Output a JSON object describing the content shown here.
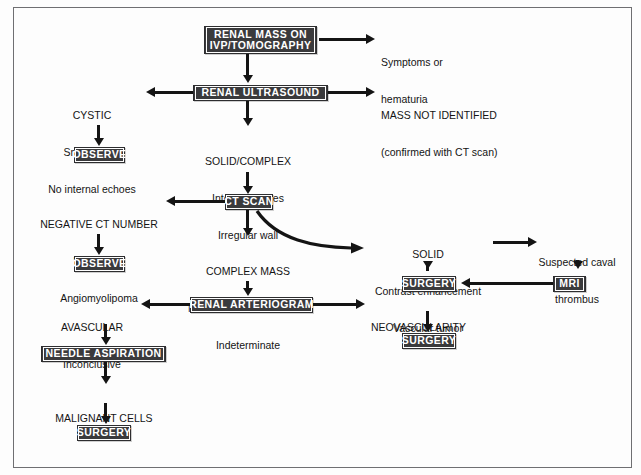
{
  "diagram": {
    "title_node": {
      "line1": "RENAL MASS ON",
      "line2": "IVP/TOMOGRAPHY"
    },
    "colors": {
      "box_fill": "#3a3a3c",
      "box_text": "#ffffff",
      "connector": "#141414",
      "frame": "#6f6f72",
      "page_bg": "#fdfdfd"
    },
    "nodes": [
      {
        "id": "renal-mass-on-ivp-tomography",
        "type": "box",
        "label": "RENAL MASS ON\nIVP/TOMOGRAPHY"
      },
      {
        "id": "symptoms-or-hematuria",
        "type": "label",
        "label": "Symptoms or\nhematuria"
      },
      {
        "id": "renal-ultrasound",
        "type": "box",
        "label": "RENAL ULTRASOUND"
      },
      {
        "id": "mass-not-identified",
        "type": "label",
        "label": "MASS NOT IDENTIFIED\n(confirmed with CT scan)"
      },
      {
        "id": "cystic",
        "type": "label",
        "label": "CYSTIC\nSmooth wall\nNo internal echoes"
      },
      {
        "id": "observe-cystic",
        "type": "box",
        "label": "OBSERVE"
      },
      {
        "id": "solid-complex",
        "type": "label",
        "label": "SOLID/COMPLEX\nInternal echoes\nIrregular wall"
      },
      {
        "id": "ct-scan",
        "type": "box",
        "label": "CT SCAN"
      },
      {
        "id": "negative-ct-number",
        "type": "label",
        "label": "NEGATIVE CT NUMBER\nFat density\nAngiomyolipoma"
      },
      {
        "id": "observe-negative-ct",
        "type": "box",
        "label": "OBSERVE"
      },
      {
        "id": "complex-mass",
        "type": "label",
        "label": "COMPLEX MASS\nNo contrast enhancement\nIndeterminate"
      },
      {
        "id": "solid-contrast-enhancement",
        "type": "label",
        "label": "SOLID\nContrast enhancement\nVascular tumor"
      },
      {
        "id": "suspected-caval-thrombus",
        "type": "label",
        "label": "Suspected caval\nthrombus"
      },
      {
        "id": "mri",
        "type": "box",
        "label": "MRI"
      },
      {
        "id": "surgery-solid",
        "type": "box",
        "label": "SURGERY"
      },
      {
        "id": "renal-arteriogram",
        "type": "box",
        "label": "RENAL ARTERIOGRAM"
      },
      {
        "id": "avascular",
        "type": "label",
        "label": "AVASCULAR\nInconclusive"
      },
      {
        "id": "neovascularity",
        "type": "label",
        "label": "NEOVASCULARITY"
      },
      {
        "id": "surgery-neovascularity",
        "type": "box",
        "label": "SURGERY"
      },
      {
        "id": "needle-aspiration",
        "type": "box",
        "label": "NEEDLE ASPIRATION"
      },
      {
        "id": "malignant-cells",
        "type": "label",
        "label": "MALIGNANT CELLS"
      },
      {
        "id": "surgery-malignant-cells",
        "type": "box",
        "label": "SURGERY"
      }
    ],
    "text": {
      "renal_mass_line1": "RENAL MASS ON",
      "renal_mass_line2": "IVP/TOMOGRAPHY",
      "symptoms_line1": "Symptoms or",
      "symptoms_line2": "hematuria",
      "renal_ultrasound": "RENAL ULTRASOUND",
      "mass_not_identified_line1": "MASS NOT IDENTIFIED",
      "mass_not_identified_line2": "(confirmed with CT scan)",
      "cystic_head": "CYSTIC",
      "cystic_line1": "Smooth wall",
      "cystic_line2": "No internal echoes",
      "observe_1": "OBSERVE",
      "solid_complex_head": "SOLID/COMPLEX",
      "solid_complex_line1": "Internal echoes",
      "solid_complex_line2": "Irregular wall",
      "ct_scan": "CT SCAN",
      "negative_ct_head": "NEGATIVE CT NUMBER",
      "negative_ct_line1": "Fat density",
      "negative_ct_line2": "Angiomyolipoma",
      "observe_2": "OBSERVE",
      "complex_mass_head": "COMPLEX MASS",
      "complex_mass_line1": "No contrast enhancement",
      "complex_mass_line2": "Indeterminate",
      "solid_head": "SOLID",
      "solid_line1": "Contrast enhancement",
      "solid_line2": "Vascular tumor",
      "caval_line1": "Suspected caval",
      "caval_line2": "thrombus",
      "mri": "MRI",
      "surgery_solid": "SURGERY",
      "renal_arteriogram": "RENAL ARTERIOGRAM",
      "avascular_head": "AVASCULAR",
      "avascular_line1": "Inconclusive",
      "neovascularity": "NEOVASCULARITY",
      "surgery_neovascularity": "SURGERY",
      "needle_aspiration": "NEEDLE ASPIRATION",
      "malignant_cells": "MALIGNANT CELLS",
      "surgery_malignant_cells": "SURGERY"
    },
    "edges": [
      {
        "from": "renal-mass-on-ivp-tomography",
        "to": "symptoms-or-hematuria",
        "dir": "right"
      },
      {
        "from": "renal-mass-on-ivp-tomography",
        "to": "renal-ultrasound",
        "dir": "down"
      },
      {
        "from": "renal-ultrasound",
        "to": "cystic",
        "dir": "left"
      },
      {
        "from": "renal-ultrasound",
        "to": "mass-not-identified",
        "dir": "right"
      },
      {
        "from": "renal-ultrasound",
        "to": "solid-complex",
        "dir": "down"
      },
      {
        "from": "cystic",
        "to": "observe-cystic",
        "dir": "down"
      },
      {
        "from": "solid-complex",
        "to": "ct-scan",
        "dir": "down"
      },
      {
        "from": "ct-scan",
        "to": "negative-ct-number",
        "dir": "left"
      },
      {
        "from": "ct-scan",
        "to": "complex-mass",
        "dir": "down"
      },
      {
        "from": "ct-scan",
        "to": "solid-contrast-enhancement",
        "dir": "curve-right"
      },
      {
        "from": "negative-ct-number",
        "to": "observe-negative-ct",
        "dir": "down"
      },
      {
        "from": "complex-mass",
        "to": "renal-arteriogram",
        "dir": "down"
      },
      {
        "from": "solid-contrast-enhancement",
        "to": "suspected-caval-thrombus",
        "dir": "right"
      },
      {
        "from": "solid-contrast-enhancement",
        "to": "surgery-solid",
        "dir": "down"
      },
      {
        "from": "suspected-caval-thrombus",
        "to": "mri",
        "dir": "down"
      },
      {
        "from": "mri",
        "to": "surgery-solid",
        "dir": "left"
      },
      {
        "from": "renal-arteriogram",
        "to": "avascular",
        "dir": "left"
      },
      {
        "from": "renal-arteriogram",
        "to": "neovascularity",
        "dir": "right"
      },
      {
        "from": "avascular",
        "to": "needle-aspiration",
        "dir": "down"
      },
      {
        "from": "neovascularity",
        "to": "surgery-neovascularity",
        "dir": "down"
      },
      {
        "from": "needle-aspiration",
        "to": "malignant-cells",
        "dir": "down"
      },
      {
        "from": "malignant-cells",
        "to": "surgery-malignant-cells",
        "dir": "down"
      }
    ]
  }
}
